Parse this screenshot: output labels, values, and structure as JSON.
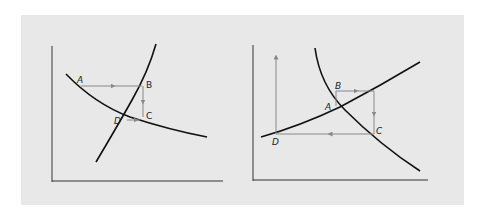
{
  "figure": {
    "background": "#ffffff",
    "panel_color": "#e8e8e8",
    "curve_color": "#111111",
    "path_color": "#777777",
    "diagrams": [
      {
        "id": "left",
        "description": "Convergent cobweb: steep increasing curve and flatter decreasing curve; path A→B→C→D spirals toward intersection",
        "points": [
          {
            "label": "A"
          },
          {
            "label": "B"
          },
          {
            "label": "C"
          },
          {
            "label": "D"
          }
        ]
      },
      {
        "id": "right",
        "description": "Divergent cobweb: flatter increasing curve and steep decreasing curve; path A→B→C→D spirals away from intersection",
        "points": [
          {
            "label": "A"
          },
          {
            "label": "B"
          },
          {
            "label": "C"
          },
          {
            "label": "D"
          }
        ]
      }
    ]
  }
}
